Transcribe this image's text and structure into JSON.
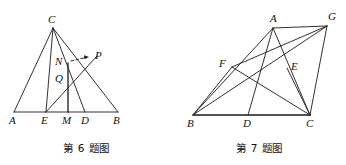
{
  "figures": [
    {
      "id": "figure-6",
      "caption": "第 6 题图",
      "stroke_color": "#1a1a1a",
      "labels": [
        {
          "name": "label-C",
          "text": "C",
          "x": 48,
          "y": 14
        },
        {
          "name": "label-N",
          "text": "N",
          "x": 55,
          "y": 57
        },
        {
          "name": "label-P",
          "text": "P",
          "x": 95,
          "y": 55
        },
        {
          "name": "label-Q",
          "text": "Q",
          "x": 55,
          "y": 75
        },
        {
          "name": "label-A",
          "text": "A",
          "x": 9,
          "y": 114
        },
        {
          "name": "label-E",
          "text": "E",
          "x": 41,
          "y": 114
        },
        {
          "name": "label-M",
          "text": "M",
          "x": 62,
          "y": 114
        },
        {
          "name": "label-D",
          "text": "D",
          "x": 81,
          "y": 114
        },
        {
          "name": "label-B",
          "text": "B",
          "x": 114,
          "y": 114
        }
      ],
      "points": {
        "A": [
          14,
          112
        ],
        "B": [
          118,
          112
        ],
        "C": [
          53,
          28
        ],
        "E": [
          46,
          112
        ],
        "M": [
          68,
          112
        ],
        "D": [
          85,
          112
        ],
        "N": [
          68,
          68
        ],
        "Q": [
          68,
          82
        ],
        "P": [
          90,
          60
        ]
      },
      "segments": [
        {
          "name": "segment-AB",
          "from": [
            14,
            112
          ],
          "to": [
            118,
            112
          ]
        },
        {
          "name": "segment-AC",
          "from": [
            14,
            112
          ],
          "to": [
            53,
            28
          ]
        },
        {
          "name": "segment-CB",
          "from": [
            53,
            28
          ],
          "to": [
            118,
            112
          ]
        },
        {
          "name": "segment-CD",
          "from": [
            53,
            28
          ],
          "to": [
            85,
            112
          ]
        },
        {
          "name": "segment-CP-E",
          "from": [
            53,
            28
          ],
          "to": [
            46,
            112
          ]
        },
        {
          "name": "segment-NM",
          "from": [
            68,
            68
          ],
          "to": [
            68,
            112
          ]
        },
        {
          "name": "segment-EP",
          "from": [
            46,
            112
          ],
          "to": [
            97,
            57
          ]
        }
      ],
      "arrow": {
        "name": "arrow-N-to-P",
        "from": [
          72,
          62
        ],
        "to": [
          88,
          58
        ]
      }
    },
    {
      "id": "figure-7",
      "caption": "第 7 题图",
      "stroke_color": "#1a1a1a",
      "labels": [
        {
          "name": "label-A",
          "text": "A",
          "x": 99,
          "y": 14
        },
        {
          "name": "label-G",
          "text": "G",
          "x": 155,
          "y": 12
        },
        {
          "name": "label-F",
          "text": "F",
          "x": 44,
          "y": 58
        },
        {
          "name": "label-E",
          "text": "E",
          "x": 119,
          "y": 62
        },
        {
          "name": "label-B",
          "text": "B",
          "x": 14,
          "y": 117
        },
        {
          "name": "label-D",
          "text": "D",
          "x": 70,
          "y": 117
        },
        {
          "name": "label-C",
          "text": "C",
          "x": 133,
          "y": 117
        }
      ],
      "points": {
        "A": [
          100,
          28
        ],
        "G": [
          154,
          26
        ],
        "F": [
          59,
          67
        ],
        "E": [
          114,
          68
        ],
        "B": [
          20,
          115
        ],
        "D": [
          75,
          115
        ],
        "C": [
          137,
          115
        ]
      },
      "segments": [
        {
          "name": "segment-BC",
          "from": [
            20,
            115
          ],
          "to": [
            137,
            115
          ]
        },
        {
          "name": "segment-BA",
          "from": [
            20,
            115
          ],
          "to": [
            100,
            28
          ]
        },
        {
          "name": "segment-AC",
          "from": [
            100,
            28
          ],
          "to": [
            137,
            115
          ]
        },
        {
          "name": "segment-AG",
          "from": [
            100,
            28
          ],
          "to": [
            154,
            26
          ]
        },
        {
          "name": "segment-GC",
          "from": [
            154,
            26
          ],
          "to": [
            137,
            115
          ]
        },
        {
          "name": "segment-GB",
          "from": [
            154,
            26
          ],
          "to": [
            20,
            115
          ]
        },
        {
          "name": "segment-GF",
          "from": [
            154,
            26
          ],
          "to": [
            59,
            67
          ]
        },
        {
          "name": "segment-FC",
          "from": [
            59,
            67
          ],
          "to": [
            137,
            115
          ]
        },
        {
          "name": "segment-FB",
          "from": [
            59,
            67
          ],
          "to": [
            20,
            115
          ]
        },
        {
          "name": "segment-AD",
          "from": [
            100,
            28
          ],
          "to": [
            75,
            115
          ]
        },
        {
          "name": "segment-EC",
          "from": [
            114,
            68
          ],
          "to": [
            137,
            115
          ]
        },
        {
          "name": "segment-BE-G",
          "from": [
            20,
            115
          ],
          "to": [
            154,
            26
          ]
        }
      ]
    }
  ]
}
